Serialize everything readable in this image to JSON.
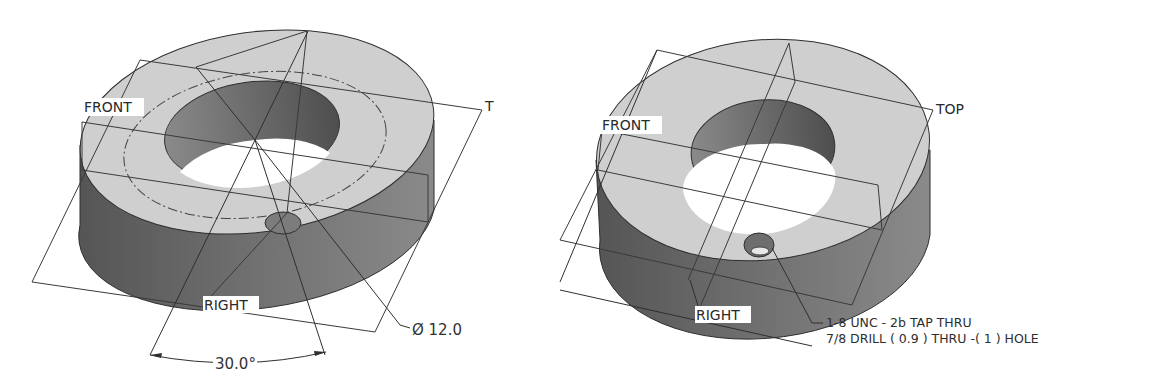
{
  "views": [
    {
      "id": "left",
      "description": "Isometric view of ring with polar hole pattern dimensions",
      "plane_labels": {
        "front": "FRONT",
        "top": "T",
        "right": "RIGHT"
      },
      "dimensions": {
        "bolt_circle": "Ø 12.0",
        "angle": "30.0°"
      }
    },
    {
      "id": "right",
      "description": "Isometric view of ring with tapped hole callout",
      "plane_labels": {
        "front": "FRONT",
        "top": "TOP",
        "right": "RIGHT"
      },
      "hole_callout": {
        "line1": "1-8 UNC - 2b TAP  THRU",
        "line2": "7/8 DRILL ( 0.9 )  THRU  -( 1 ) HOLE"
      }
    }
  ],
  "colors": {
    "top_face": "#cfcfcf",
    "outer_wall": "#7a7a7a",
    "inner_wall": "#6a6a6a",
    "edge": "#2f2f2f",
    "background": "#ffffff"
  }
}
